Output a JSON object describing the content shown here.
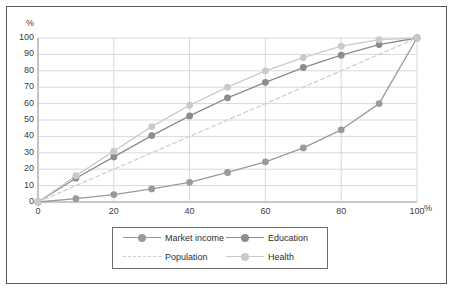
{
  "chart_data": {
    "type": "line",
    "title": "",
    "xlabel": "%",
    "ylabel": "%",
    "xlim": [
      0,
      100
    ],
    "ylim": [
      0,
      100
    ],
    "x_ticks": [
      0,
      20,
      40,
      60,
      80,
      100
    ],
    "y_ticks": [
      0,
      10,
      20,
      30,
      40,
      50,
      60,
      70,
      80,
      90,
      100
    ],
    "grid": true,
    "legend_position": "bottom",
    "x": [
      0,
      10,
      20,
      30,
      40,
      50,
      60,
      70,
      80,
      90,
      100
    ],
    "series": [
      {
        "name": "Market income",
        "color": "#9a9a9a",
        "style": "solid",
        "marker": "circle",
        "values": [
          0,
          2,
          4.5,
          8,
          12,
          18,
          24.5,
          33,
          44,
          60,
          100
        ]
      },
      {
        "name": "Education",
        "color": "#8c8c8c",
        "style": "solid",
        "marker": "circle",
        "values": [
          0,
          14.5,
          27.5,
          40.5,
          52.5,
          63.5,
          73,
          82,
          89.5,
          96,
          100
        ]
      },
      {
        "name": "Population",
        "color": "#cfcfcf",
        "style": "dashed",
        "marker": "none",
        "values": [
          0,
          10,
          20,
          30,
          40,
          50,
          60,
          70,
          80,
          90,
          100
        ]
      },
      {
        "name": "Health",
        "color": "#cacaca",
        "style": "solid",
        "marker": "circle",
        "values": [
          0,
          16,
          31,
          46,
          59,
          70,
          80,
          88,
          95,
          99,
          100
        ]
      }
    ]
  },
  "axes": {
    "y_unit": "%",
    "x_unit": "%",
    "y_tick_labels": [
      "100",
      "90",
      "80",
      "70",
      "60",
      "50",
      "40",
      "30",
      "20",
      "10",
      "0"
    ],
    "x_tick_labels": [
      "0",
      "20",
      "40",
      "60",
      "80",
      "100"
    ]
  },
  "legend": {
    "entries": [
      {
        "label": "Market income",
        "color": "#9a9a9a",
        "style": "solid",
        "marker": true
      },
      {
        "label": "Education",
        "color": "#8c8c8c",
        "style": "solid",
        "marker": true
      },
      {
        "label": "Population",
        "color": "#cfcfcf",
        "style": "dashed",
        "marker": false
      },
      {
        "label": "Health",
        "color": "#cacaca",
        "style": "solid",
        "marker": true
      }
    ]
  },
  "colors": {
    "frame": "#5a5a5a",
    "grid": "#d9d9d9",
    "axis": "#b5b5b5",
    "text": "#3c3c3c",
    "background": "#ffffff"
  }
}
